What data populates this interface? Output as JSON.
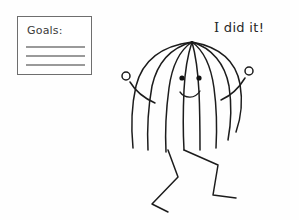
{
  "canvas": {
    "width": 299,
    "height": 220,
    "background_color": "#fefefe",
    "ink_color": "#1c1c1c"
  },
  "note": {
    "title": "Goals:",
    "title_color": "#3b3b3b",
    "border_color": "#6e6e6e",
    "rule_color": "#9a9a9a",
    "rule_count": 3,
    "rules": [
      "",
      "",
      ""
    ]
  },
  "caption": {
    "text": "I did it!",
    "lead_letter": "I",
    "rest": " did  it!",
    "color": "#262626"
  },
  "figure": {
    "name": "celebrating-stick-figure",
    "expression": "smiling",
    "eyes": 2,
    "hair_strands": 9,
    "arms": 2,
    "legs": 2,
    "hands": "open-circles",
    "pose": "arms-raised-dancing"
  }
}
